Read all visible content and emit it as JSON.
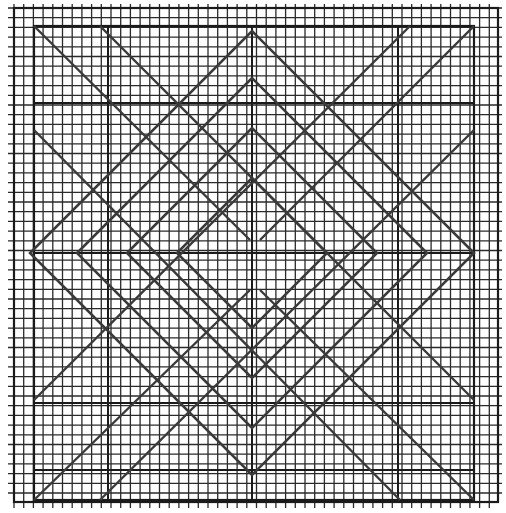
{
  "colors": {
    "background": "#ffffff",
    "grid": "#2a2a2a",
    "heavy": "#1a1a1a",
    "diagonal": "#3a3a3a"
  },
  "grid": {
    "x0": 14,
    "y0": 8,
    "x1": 498,
    "y1": 502,
    "spacing": 9.7
  },
  "outer_frame": {
    "x": 14,
    "y": 8,
    "w": 484,
    "h": 494
  },
  "inner_square": {
    "x": 34,
    "y": 26,
    "w": 440,
    "h": 474
  },
  "center": {
    "x": 252,
    "y": 253
  },
  "diamonds": [
    75,
    125,
    175,
    222
  ],
  "heavy_lines": {
    "h": [
      26,
      103,
      253,
      403,
      470
    ],
    "v": [
      34,
      108,
      252,
      398,
      474
    ]
  },
  "corner_diagonals": [
    [
      34,
      26,
      250,
      240
    ],
    [
      410,
      26,
      34,
      400
    ],
    [
      474,
      26,
      260,
      240
    ],
    [
      100,
      26,
      474,
      400
    ],
    [
      34,
      500,
      250,
      290
    ],
    [
      400,
      500,
      34,
      130
    ],
    [
      474,
      500,
      260,
      290
    ],
    [
      100,
      500,
      474,
      130
    ]
  ]
}
